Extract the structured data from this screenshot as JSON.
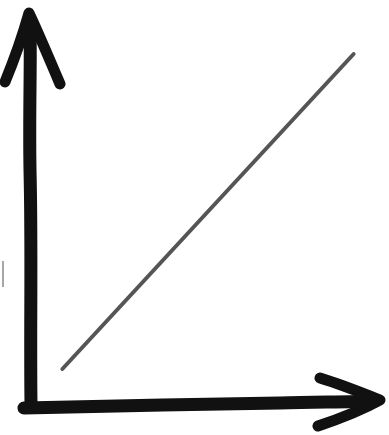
{
  "chart_data": {
    "type": "line",
    "title": "",
    "xlabel": "",
    "ylabel": "",
    "x": [
      0.1,
      1.0
    ],
    "series": [
      {
        "name": "",
        "values": [
          0.1,
          1.0
        ],
        "color": "#555555"
      }
    ],
    "xlim": [
      0,
      1.1
    ],
    "ylim": [
      0,
      1.1
    ],
    "grid": false,
    "legend": "none",
    "axis_color": "#111111",
    "style": "hand-drawn"
  }
}
